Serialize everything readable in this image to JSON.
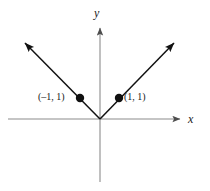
{
  "figure": {
    "title": "",
    "background_color": "#ffffff",
    "width": 210,
    "height": 191
  },
  "axes": {
    "x_label": "x",
    "y_label": "y",
    "axis_color": "#8c8c8c",
    "origin": {
      "x": 100,
      "y": 119
    },
    "x_axis": {
      "start_x": 8,
      "end_x": 182,
      "y": 119,
      "arrow_end": "right"
    },
    "y_axis": {
      "x": 100,
      "start_y": 26,
      "end_y": 182,
      "arrow_end": "top"
    }
  },
  "curve": {
    "name": "absolute-value",
    "equation": "y = |x|",
    "color": "#111111",
    "left_arm": {
      "from_x": 100,
      "from_y": 119,
      "to_x": 23,
      "to_y": 41
    },
    "right_arm": {
      "from_x": 100,
      "from_y": 119,
      "to_x": 176,
      "to_y": 41
    }
  },
  "points": [
    {
      "name": "point-left",
      "label": "(–1, 1)",
      "x_value": -1,
      "y_value": 1,
      "px": 80,
      "py": 98,
      "color": "#111111"
    },
    {
      "name": "point-right",
      "label": "(1, 1)",
      "x_value": 1,
      "y_value": 1,
      "px": 119,
      "py": 98,
      "color": "#111111"
    }
  ],
  "chart_data": {
    "type": "line",
    "title": "",
    "xlabel": "x",
    "ylabel": "y",
    "equation": "y = |x|",
    "grid": false,
    "legend": "none",
    "xlim": [
      -2.4,
      2.1
    ],
    "ylim": [
      -1.6,
      2.4
    ],
    "series": [
      {
        "name": "y = |x|",
        "x": [
          -2.0,
          -1.0,
          0.0,
          1.0,
          2.0
        ],
        "values": [
          2.0,
          1.0,
          0.0,
          1.0,
          2.0
        ],
        "color": "#111111",
        "arrows": [
          "start",
          "end"
        ]
      }
    ],
    "annotations": [
      {
        "text": "(–1, 1)",
        "x": -1,
        "y": 1,
        "position": "left"
      },
      {
        "text": "(1, 1)",
        "x": 1,
        "y": 1,
        "position": "right"
      }
    ],
    "markers": [
      {
        "x": -1,
        "y": 1,
        "style": "filled-circle"
      },
      {
        "x": 1,
        "y": 1,
        "style": "filled-circle"
      }
    ]
  }
}
